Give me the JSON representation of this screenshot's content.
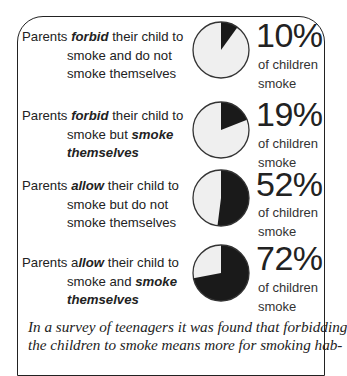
{
  "rows": [
    {
      "desc_prefix": "Parents ",
      "desc_em": "forbid",
      "desc_rest": " their child to",
      "line2": "smoke and do not",
      "line2_em": "",
      "line3": "smoke themselves",
      "line3_em": "",
      "percent": "10%",
      "sub1": "of children",
      "sub2": "smoke"
    },
    {
      "desc_prefix": "Parents ",
      "desc_em": "forbid",
      "desc_rest": " their child to",
      "line2": "smoke but ",
      "line2_em": "smoke",
      "line3": "",
      "line3_em": "themselves",
      "percent": "19%",
      "sub1": "of children",
      "sub2": "smoke"
    },
    {
      "desc_prefix": "Parents ",
      "desc_em": "allow",
      "desc_rest": " their child to",
      "line2": "smoke but do not",
      "line2_em": "",
      "line3": "smoke themselves",
      "line3_em": "",
      "percent": "52%",
      "sub1": "of children",
      "sub2": "smoke"
    },
    {
      "desc_prefix": "Parents a",
      "desc_em": "llow",
      "desc_rest": " their child to",
      "line2": "smoke and ",
      "line2_em": "smoke",
      "line3": "",
      "line3_em": "themselves",
      "percent": "72%",
      "sub1": "of children",
      "sub2": "smoke"
    }
  ],
  "caption": {
    "line1": "In a survey of teenagers it was found that forbidding",
    "line2": "the children to smoke means more for smoking hab-"
  },
  "colors": {
    "slice_dark": "#1a1a1a",
    "slice_light": "#efefef",
    "outline": "#333333"
  },
  "chart_data": {
    "type": "pie",
    "title": "",
    "categories": [
      "Parents forbid their child to smoke and do not smoke themselves",
      "Parents forbid their child to smoke but smoke themselves",
      "Parents allow their child to smoke but do not smoke themselves",
      "Parents allow their child to smoke and smoke themselves"
    ],
    "values": [
      10,
      19,
      52,
      72
    ],
    "unit": "% of children smoke",
    "series": [
      {
        "name": "Children who smoke (%)",
        "values": [
          10,
          19,
          52,
          72
        ]
      },
      {
        "name": "Children who do not smoke (%)",
        "values": [
          90,
          81,
          48,
          28
        ]
      }
    ],
    "annotations": [
      "10%",
      "19%",
      "52%",
      "72%",
      "of children smoke"
    ]
  }
}
